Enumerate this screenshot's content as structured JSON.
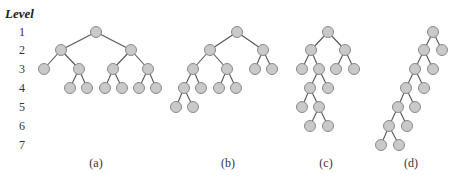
{
  "figure": {
    "level_axis": {
      "title": "Level",
      "x": 22,
      "levels": [
        {
          "label": "1",
          "y": 32
        },
        {
          "label": "2",
          "y": 50
        },
        {
          "label": "3",
          "y": 69
        },
        {
          "label": "4",
          "y": 88
        },
        {
          "label": "5",
          "y": 107
        },
        {
          "label": "6",
          "y": 126
        },
        {
          "label": "7",
          "y": 145
        }
      ]
    },
    "node_radius": 5.5,
    "colors": {
      "node_fill": "#c9c9c9",
      "node_stroke": "#8a8a8a",
      "edge": "#555555"
    },
    "trees": [
      {
        "caption": "(a)",
        "caption_x": 96,
        "nodes": [
          [
            96,
            32
          ],
          [
            61,
            50
          ],
          [
            131,
            50
          ],
          [
            44,
            69
          ],
          [
            79,
            69
          ],
          [
            113,
            69
          ],
          [
            148,
            69
          ],
          [
            70,
            88
          ],
          [
            87,
            88
          ],
          [
            105,
            88
          ],
          [
            122,
            88
          ],
          [
            139,
            88
          ],
          [
            156,
            88
          ]
        ],
        "edges": [
          [
            0,
            1
          ],
          [
            0,
            2
          ],
          [
            1,
            3
          ],
          [
            1,
            4
          ],
          [
            2,
            5
          ],
          [
            2,
            6
          ],
          [
            4,
            7
          ],
          [
            4,
            8
          ],
          [
            5,
            9
          ],
          [
            5,
            10
          ],
          [
            6,
            11
          ],
          [
            6,
            12
          ]
        ]
      },
      {
        "caption": "(b)",
        "caption_x": 228,
        "nodes": [
          [
            237,
            32
          ],
          [
            210,
            50
          ],
          [
            263,
            50
          ],
          [
            193,
            69
          ],
          [
            227,
            69
          ],
          [
            255,
            69
          ],
          [
            272,
            69
          ],
          [
            184,
            88
          ],
          [
            201,
            88
          ],
          [
            219,
            88
          ],
          [
            236,
            88
          ],
          [
            176,
            107
          ],
          [
            193,
            107
          ]
        ],
        "edges": [
          [
            0,
            1
          ],
          [
            0,
            2
          ],
          [
            1,
            3
          ],
          [
            1,
            4
          ],
          [
            2,
            5
          ],
          [
            2,
            6
          ],
          [
            3,
            7
          ],
          [
            3,
            8
          ],
          [
            4,
            9
          ],
          [
            4,
            10
          ],
          [
            7,
            11
          ],
          [
            7,
            12
          ]
        ]
      },
      {
        "caption": "(c)",
        "caption_x": 326,
        "nodes": [
          [
            328,
            32
          ],
          [
            311,
            50
          ],
          [
            345,
            50
          ],
          [
            302,
            69
          ],
          [
            319,
            69
          ],
          [
            336,
            69
          ],
          [
            354,
            69
          ],
          [
            310,
            88
          ],
          [
            328,
            88
          ],
          [
            302,
            107
          ],
          [
            319,
            107
          ],
          [
            310,
            126
          ],
          [
            328,
            126
          ]
        ],
        "edges": [
          [
            0,
            1
          ],
          [
            0,
            2
          ],
          [
            1,
            3
          ],
          [
            1,
            4
          ],
          [
            2,
            5
          ],
          [
            2,
            6
          ],
          [
            4,
            7
          ],
          [
            4,
            8
          ],
          [
            7,
            9
          ],
          [
            7,
            10
          ],
          [
            10,
            11
          ],
          [
            10,
            12
          ]
        ]
      },
      {
        "caption": "(d)",
        "caption_x": 411,
        "nodes": [
          [
            433,
            32
          ],
          [
            424,
            50
          ],
          [
            442,
            50
          ],
          [
            415,
            69
          ],
          [
            433,
            69
          ],
          [
            406,
            88
          ],
          [
            424,
            88
          ],
          [
            398,
            107
          ],
          [
            415,
            107
          ],
          [
            389,
            126
          ],
          [
            407,
            126
          ],
          [
            381,
            145
          ],
          [
            399,
            145
          ]
        ],
        "edges": [
          [
            0,
            1
          ],
          [
            0,
            2
          ],
          [
            1,
            3
          ],
          [
            1,
            4
          ],
          [
            3,
            5
          ],
          [
            3,
            6
          ],
          [
            5,
            7
          ],
          [
            5,
            8
          ],
          [
            7,
            9
          ],
          [
            7,
            10
          ],
          [
            9,
            11
          ],
          [
            9,
            12
          ]
        ]
      }
    ],
    "caption_y": 167
  }
}
